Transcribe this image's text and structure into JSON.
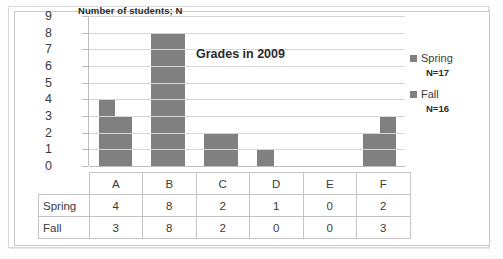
{
  "chart_data": {
    "type": "bar",
    "title": "Grades in 2009",
    "inline_axis_title": "Number of students; N",
    "xlabel": "",
    "ylabel": "Number of students; N",
    "categories": [
      "A",
      "B",
      "C",
      "D",
      "E",
      "F"
    ],
    "series": [
      {
        "name": "Spring",
        "subtitle": "N=17",
        "values": [
          4,
          8,
          2,
          1,
          0,
          2
        ]
      },
      {
        "name": "Fall",
        "subtitle": "N=16",
        "values": [
          3,
          8,
          2,
          0,
          0,
          3
        ]
      }
    ],
    "ylim": [
      0,
      9
    ],
    "yticks": [
      9,
      8,
      7,
      6,
      5,
      4,
      3,
      2,
      1,
      0
    ],
    "grid": true,
    "legend_position": "right",
    "bar_color": "#808080",
    "gridline_color": "#d6d6d6"
  },
  "table": {
    "header": [
      "",
      "A",
      "B",
      "C",
      "D",
      "E",
      "F"
    ],
    "rows": [
      {
        "label": "Spring",
        "values": [
          "4",
          "8",
          "2",
          "1",
          "0",
          "2"
        ]
      },
      {
        "label": "Fall",
        "values": [
          "3",
          "8",
          "2",
          "0",
          "0",
          "3"
        ]
      }
    ]
  }
}
